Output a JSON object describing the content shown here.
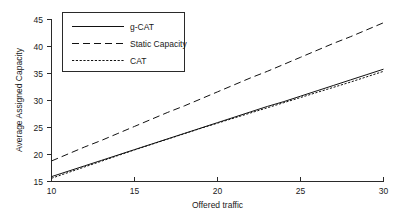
{
  "figure": {
    "background_color": "#ffffff",
    "line_color": "#111111",
    "axis_color": "#2a2a2a"
  },
  "chart_data": {
    "type": "line",
    "title": "",
    "xlabel": "Offered traffic",
    "ylabel": "Average Assigned Capacity",
    "xlim": [
      10,
      30
    ],
    "ylim": [
      15,
      45
    ],
    "xticks": [
      10,
      15,
      20,
      25,
      30
    ],
    "yticks": [
      15,
      20,
      25,
      30,
      35,
      40,
      45
    ],
    "xtick_labels": [
      "10",
      "15",
      "20",
      "25",
      "30"
    ],
    "ytick_labels": [
      "15",
      "20",
      "25",
      "30",
      "35",
      "40",
      "45"
    ],
    "grid": false,
    "legend_position": "upper left",
    "x": [
      10,
      11,
      12,
      13,
      14,
      15,
      16,
      17,
      18,
      19,
      20,
      21,
      22,
      23,
      24,
      25,
      26,
      27,
      28,
      29,
      30
    ],
    "series": [
      {
        "name": "g-CAT",
        "style": "solid",
        "values": [
          15.9,
          16.9,
          17.9,
          18.9,
          19.9,
          20.9,
          21.9,
          22.9,
          23.9,
          24.9,
          25.9,
          26.9,
          27.9,
          28.9,
          29.8,
          30.8,
          31.8,
          32.8,
          33.8,
          34.8,
          35.8
        ]
      },
      {
        "name": "Static Capacity",
        "style": "dashed",
        "values": [
          18.8,
          20.1,
          21.4,
          22.6,
          23.9,
          25.2,
          26.5,
          27.8,
          29.0,
          30.3,
          31.6,
          32.9,
          34.2,
          35.4,
          36.7,
          38.0,
          39.3,
          40.6,
          41.8,
          43.1,
          44.4
        ]
      },
      {
        "name": "CAT",
        "style": "dotted",
        "values": [
          15.6,
          16.65,
          17.7,
          18.75,
          19.8,
          20.85,
          21.85,
          22.85,
          23.85,
          24.85,
          25.8,
          26.75,
          27.7,
          28.65,
          29.6,
          30.55,
          31.5,
          32.45,
          33.4,
          34.4,
          35.4
        ]
      }
    ]
  },
  "legend": {
    "entries": [
      {
        "label": "g-CAT",
        "style": "solid"
      },
      {
        "label": "Static Capacity",
        "style": "dashed"
      },
      {
        "label": "CAT",
        "style": "dotted"
      }
    ]
  }
}
